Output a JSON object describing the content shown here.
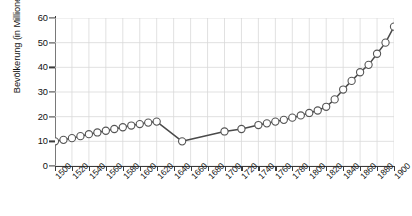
{
  "chart_data": {
    "type": "line",
    "title": "",
    "subtitle": "",
    "xlabel": "",
    "ylabel": "Bevölkerung (in Millionen)",
    "xlim": [
      1500,
      1900
    ],
    "ylim": [
      0,
      60
    ],
    "ytick_values": [
      0,
      10,
      20,
      30,
      40,
      50,
      60
    ],
    "ytick_labels": [
      "0",
      "10",
      "20",
      "30",
      "40",
      "50",
      "60"
    ],
    "xtick_values": [
      1500,
      1520,
      1540,
      1560,
      1580,
      1600,
      1620,
      1640,
      1660,
      1680,
      1700,
      1720,
      1740,
      1760,
      1780,
      1800,
      1820,
      1840,
      1860,
      1880,
      1900
    ],
    "xtick_labels": [
      "1500",
      "1520",
      "1540",
      "1560",
      "1580",
      "1600",
      "1620",
      "1640",
      "1660",
      "1680",
      "1700",
      "1720",
      "1740",
      "1760",
      "1780",
      "1800",
      "1820",
      "1840",
      "1860",
      "1880",
      "1900"
    ],
    "grid": true,
    "grid_color": "#d9d9d9",
    "legend": false,
    "legend_position": "none",
    "line_color": "#4a4a4a",
    "marker": "circle-open",
    "marker_face_color": "#ffffff",
    "marker_edge_color": "#555555",
    "series": [
      {
        "name": "Bevölkerung",
        "x": [
          1500,
          1510,
          1520,
          1530,
          1540,
          1550,
          1560,
          1570,
          1580,
          1590,
          1600,
          1610,
          1620,
          1650,
          1700,
          1720,
          1740,
          1750,
          1760,
          1770,
          1780,
          1790,
          1800,
          1810,
          1820,
          1830,
          1840,
          1850,
          1860,
          1870,
          1880,
          1890,
          1900
        ],
        "y": [
          10.0,
          10.6,
          11.3,
          12.1,
          12.9,
          13.6,
          14.3,
          15.0,
          15.7,
          16.4,
          17.0,
          17.6,
          18.0,
          10.0,
          14.0,
          15.0,
          16.6,
          17.3,
          18.0,
          18.7,
          19.6,
          20.5,
          21.5,
          22.5,
          24.0,
          27.0,
          31.0,
          34.5,
          38.0,
          41.0,
          45.5,
          50.0,
          56.5
        ]
      }
    ]
  }
}
